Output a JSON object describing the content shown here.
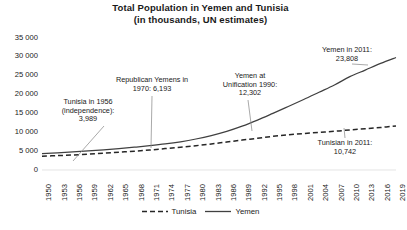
{
  "chart_data": {
    "type": "line",
    "title": "Total Population in Yemen and Tunisia",
    "subtitle": "(in thousands, UN estimates)",
    "xlabel": "",
    "ylabel": "",
    "ylim": [
      0,
      35000
    ],
    "xlim": [
      1950,
      2019
    ],
    "grid": false,
    "legend_position": "bottom",
    "ytick_labels": [
      "35 000",
      "30 000",
      "25 000",
      "20 000",
      "15 000",
      "10 000",
      "5 000",
      "0"
    ],
    "ytick_values": [
      35000,
      30000,
      25000,
      20000,
      15000,
      10000,
      5000,
      0
    ],
    "xtick_labels": [
      "1950",
      "1953",
      "1956",
      "1959",
      "1962",
      "1965",
      "1968",
      "1971",
      "1974",
      "1977",
      "1980",
      "1983",
      "1986",
      "1989",
      "1992",
      "1995",
      "1998",
      "2001",
      "2004",
      "2007",
      "2010",
      "2013",
      "2016",
      "2019"
    ],
    "x": [
      1950,
      1953,
      1956,
      1959,
      1962,
      1965,
      1968,
      1971,
      1974,
      1977,
      1980,
      1983,
      1986,
      1989,
      1992,
      1995,
      1998,
      2001,
      2004,
      2007,
      2010,
      2013,
      2016,
      2019
    ],
    "series": [
      {
        "name": "Yemen",
        "style": "solid",
        "color": "#404040",
        "values": [
          4316,
          4533,
          4776,
          5052,
          5355,
          5686,
          6046,
          6441,
          6900,
          7482,
          8221,
          9127,
          10233,
          11613,
          13243,
          15028,
          16850,
          18685,
          20608,
          22533,
          24744,
          26498,
          28251,
          29826
        ]
      },
      {
        "name": "Tunisia",
        "style": "dashed",
        "color": "#262626",
        "values": [
          3639,
          3812,
          3989,
          4216,
          4470,
          4728,
          4976,
          5298,
          5668,
          6058,
          6457,
          6901,
          7418,
          7930,
          8419,
          8935,
          9343,
          9674,
          9971,
          10258,
          10635,
          10927,
          11272,
          11695
        ]
      }
    ],
    "annotations": [
      {
        "id": "tunisia-1956",
        "lines": [
          "Tunisia in 1956",
          "(independence):",
          "3,989"
        ],
        "year": 1956,
        "value": 3989
      },
      {
        "id": "republican-yemens-1970",
        "lines": [
          "Republican Yemens in",
          "1970: 6,193"
        ],
        "year": 1970,
        "value": 6193
      },
      {
        "id": "yemen-unification-1990",
        "lines": [
          "Yemen at",
          "Unification 1990:",
          "12,302"
        ],
        "year": 1990,
        "value": 12302
      },
      {
        "id": "yemen-2011",
        "lines": [
          "Yemen in 2011:",
          "23,808"
        ],
        "year": 2011,
        "value": 23808
      },
      {
        "id": "tunisian-2011",
        "lines": [
          "Tunisian in 2011:",
          "10,742"
        ],
        "year": 2011,
        "value": 10742
      }
    ],
    "legend": [
      {
        "label": "Tunisia",
        "style": "dashed"
      },
      {
        "label": "Yemen",
        "style": "solid"
      }
    ]
  }
}
